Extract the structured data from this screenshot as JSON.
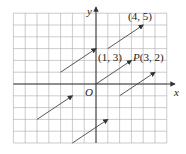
{
  "figure": {
    "axes": {
      "x_label": "x",
      "y_label": "y",
      "origin_label": "O"
    },
    "grid": {
      "x_range": [
        -7,
        6
      ],
      "y_range": [
        -5,
        6
      ],
      "unit": 1
    },
    "points": [
      {
        "label": "(4, 5)",
        "x": 4,
        "y": 5
      },
      {
        "label": "(1, 3)",
        "x": 1,
        "y": 3
      },
      {
        "label": "P(3, 2)",
        "name": "P",
        "coords": "(3, 2)",
        "x": 3,
        "y": 2
      }
    ],
    "vectors": [
      {
        "from": [
          0,
          0
        ],
        "to": [
          3,
          2
        ]
      },
      {
        "from": [
          1,
          3
        ],
        "to": [
          4,
          5
        ]
      },
      {
        "from": [
          -3,
          1
        ],
        "to": [
          0,
          3
        ]
      },
      {
        "from": [
          -5,
          -3
        ],
        "to": [
          -2,
          -1
        ]
      },
      {
        "from": [
          -2,
          -5
        ],
        "to": [
          1,
          -3
        ]
      },
      {
        "from": [
          2,
          -1
        ],
        "to": [
          5,
          1
        ]
      }
    ]
  }
}
